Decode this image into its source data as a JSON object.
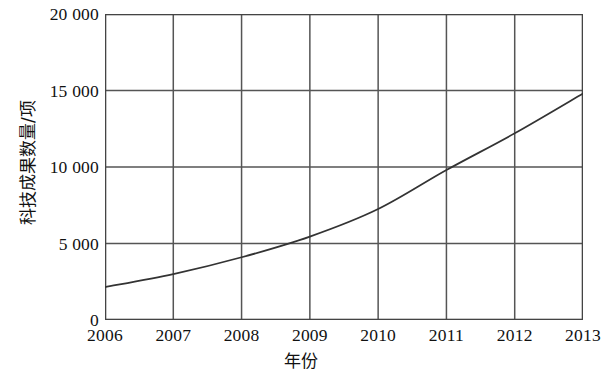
{
  "chart_data": {
    "type": "line",
    "title": "",
    "subtitle": "",
    "xlabel": "年份",
    "ylabel": "科技成果数量/项",
    "x": [
      2006,
      2007,
      2008,
      2009,
      2010,
      2011,
      2012,
      2013
    ],
    "xtick_labels": [
      "2006",
      "2007",
      "2008",
      "2009",
      "2010",
      "2011",
      "2012",
      "2013"
    ],
    "ytick_labels": [
      "0",
      "5 000",
      "10 000",
      "15 000",
      "20 000"
    ],
    "ytick_values": [
      0,
      5000,
      10000,
      15000,
      20000
    ],
    "xlim": [
      2006,
      2013
    ],
    "ylim": [
      0,
      20000
    ],
    "grid": true,
    "legend": "none",
    "series": [
      {
        "name": "科技成果数量",
        "values": [
          2150,
          3000,
          4100,
          5450,
          7250,
          9800,
          12200,
          14800
        ],
        "color": "#333333"
      }
    ],
    "line_color": "#333333",
    "grid_color": "#555555",
    "axis_color": "#444444",
    "background": "#ffffff"
  }
}
